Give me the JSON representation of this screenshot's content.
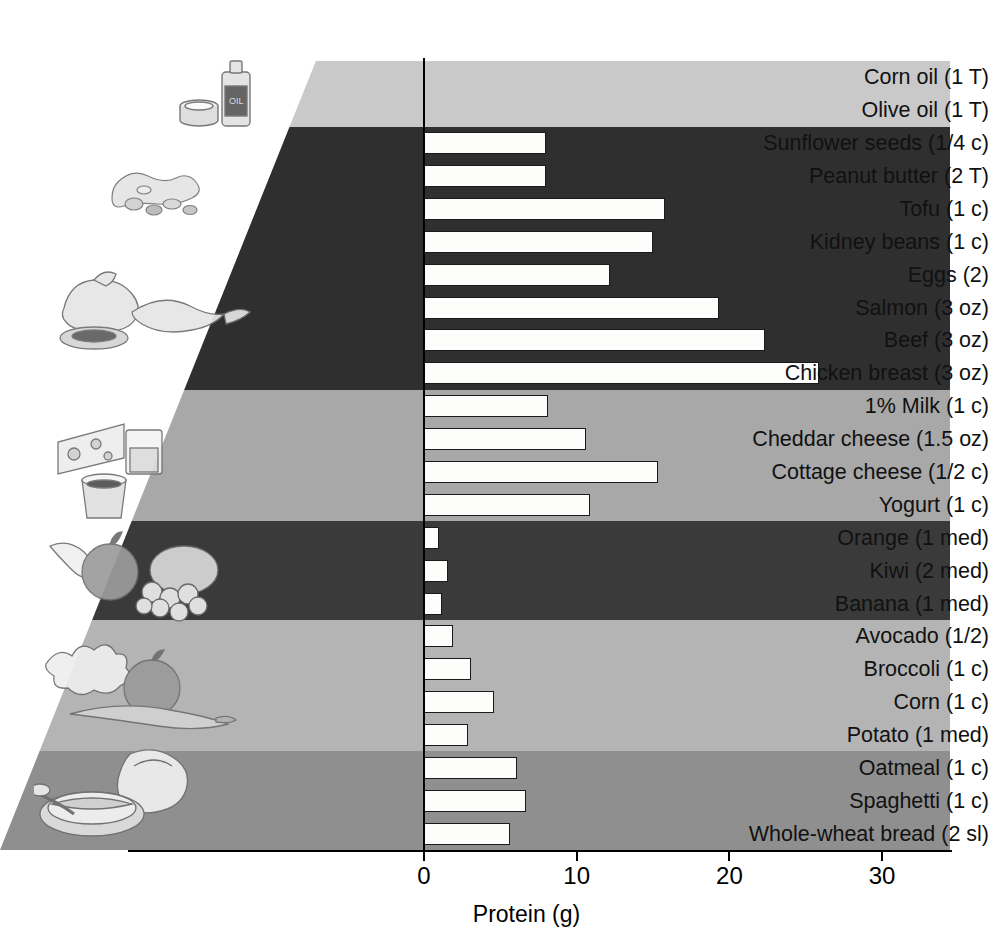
{
  "chart_data": {
    "type": "bar",
    "title": "",
    "xlabel": "Protein (g)",
    "ylabel": "",
    "orientation": "horizontal",
    "xlim": [
      0,
      34.4
    ],
    "xticks": [
      0,
      10,
      20,
      30
    ],
    "xtick_labels": [
      "0",
      "10",
      "20",
      "30"
    ],
    "grid": false,
    "legend": "none",
    "categories": [
      "Corn oil (1 T)",
      "Olive oil (1 T)",
      "Sunflower seeds (1/4 c)",
      "Peanut butter (2 T)",
      "Tofu (1 c)",
      "Kidney beans (1 c)",
      "Eggs (2)",
      "Salmon (3 oz)",
      "Beef (3 oz)",
      "Chicken breast (3 oz)",
      "1% Milk (1 c)",
      "Cheddar cheese (1.5 oz)",
      "Cottage cheese (1/2 c)",
      "Yogurt (1 c)",
      "Orange (1 med)",
      "Kiwi (2 med)",
      "Banana (1 med)",
      "Avocado (1/2)",
      "Broccoli (1 c)",
      "Corn (1 c)",
      "Potato (1 med)",
      "Oatmeal (1 c)",
      "Spaghetti (1 c)",
      "Whole-wheat bread (2 sl)"
    ],
    "values": [
      0,
      0,
      8.0,
      8.0,
      15.8,
      15.0,
      12.2,
      19.3,
      22.3,
      25.9,
      8.1,
      10.6,
      15.3,
      10.9,
      1.0,
      1.6,
      1.2,
      1.9,
      3.1,
      4.6,
      2.9,
      6.1,
      6.7,
      5.6
    ]
  },
  "groups": [
    {
      "name": "fats-oils",
      "color": "#c9c9c9",
      "count": 2
    },
    {
      "name": "protein-foods",
      "color": "#2f2f2f",
      "count": 8
    },
    {
      "name": "dairy",
      "color": "#a8a8a8",
      "count": 4
    },
    {
      "name": "fruits",
      "color": "#3a3a3a",
      "count": 3
    },
    {
      "name": "vegetables",
      "color": "#b4b4b4",
      "count": 4
    },
    {
      "name": "grains",
      "color": "#8f8f8f",
      "count": 3
    }
  ],
  "axis": {
    "x_title": "Protein (g)",
    "ticks": [
      "0",
      "10",
      "20",
      "30"
    ]
  },
  "illustrations": [
    {
      "name": "oil-bottle-and-butter-illustration",
      "label": "oil"
    },
    {
      "name": "nuts-and-seeds-illustration",
      "label": "nuts"
    },
    {
      "name": "meat-fish-poultry-illustration",
      "label": "meat"
    },
    {
      "name": "cheese-and-milk-illustration",
      "label": "dairy"
    },
    {
      "name": "fruit-illustration",
      "label": "fruit"
    },
    {
      "name": "vegetables-illustration",
      "label": "vegetables"
    },
    {
      "name": "bread-and-cereal-illustration",
      "label": "grains"
    }
  ],
  "bar_style": {
    "fill": "#fdfdfb",
    "stroke": "#1a1a1a"
  }
}
